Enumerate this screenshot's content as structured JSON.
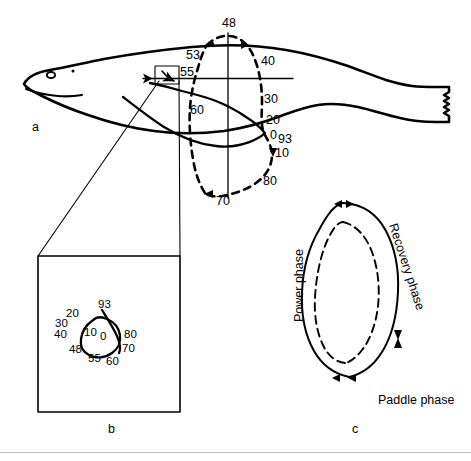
{
  "figure": {
    "caption_letters": {
      "panel_a": "a",
      "panel_b": "b",
      "panel_c": "c"
    }
  },
  "panel_a": {
    "letter": "a",
    "subject": "harbor-seal-lateral-outline",
    "trajectory_labels": [
      {
        "id": "a-48",
        "text": "48",
        "x": 222,
        "y": 27
      },
      {
        "id": "a-53",
        "text": "53",
        "x": 186,
        "y": 59
      },
      {
        "id": "a-55",
        "text": "55",
        "x": 180,
        "y": 76
      },
      {
        "id": "a-40",
        "text": "40",
        "x": 261,
        "y": 65
      },
      {
        "id": "a-30",
        "text": "30",
        "x": 264,
        "y": 103
      },
      {
        "id": "a-60",
        "text": "60",
        "x": 190,
        "y": 114
      },
      {
        "id": "a-20",
        "text": "20",
        "x": 266,
        "y": 124
      },
      {
        "id": "a-0",
        "text": "0",
        "x": 272,
        "y": 137
      },
      {
        "id": "a-93",
        "text": "93",
        "x": 279,
        "y": 140
      },
      {
        "id": "a-10",
        "text": "10",
        "x": 275,
        "y": 155
      },
      {
        "id": "a-80",
        "text": "80",
        "x": 263,
        "y": 183
      },
      {
        "id": "a-70",
        "text": "70",
        "x": 218,
        "y": 203
      }
    ]
  },
  "panel_b": {
    "letter": "b",
    "description": "magnified-stroke-loop",
    "loop_labels": [
      {
        "id": "b-20",
        "text": "20",
        "x": 72,
        "y": 315
      },
      {
        "id": "b-93",
        "text": "93",
        "x": 103,
        "y": 307
      },
      {
        "id": "b-30",
        "text": "30",
        "x": 60,
        "y": 325
      },
      {
        "id": "b-40",
        "text": "40",
        "x": 59,
        "y": 336
      },
      {
        "id": "b-10",
        "text": "10",
        "x": 86,
        "y": 331
      },
      {
        "id": "b-0",
        "text": "0",
        "x": 101,
        "y": 334
      },
      {
        "id": "b-80",
        "text": "80",
        "x": 123,
        "y": 332
      },
      {
        "id": "b-48",
        "text": "48",
        "x": 72,
        "y": 350
      },
      {
        "id": "b-70",
        "text": "70",
        "x": 122,
        "y": 349
      },
      {
        "id": "b-55",
        "text": "55",
        "x": 90,
        "y": 359
      },
      {
        "id": "b-60",
        "text": "60",
        "x": 108,
        "y": 361
      }
    ]
  },
  "panel_c": {
    "letter": "c",
    "description": "stroke-cycle-phase-diagram",
    "phases": [
      {
        "id": "power-phase",
        "label": "Power phase",
        "orientation": "vertical-up"
      },
      {
        "id": "recovery-phase",
        "label": "Recovery phase",
        "orientation": "rotated-down"
      },
      {
        "id": "paddle-phase",
        "label": "Paddle phase",
        "orientation": "horizontal"
      }
    ]
  },
  "colors": {
    "ink": "#000000",
    "background": "#ffffff",
    "rule": "#b9b9b9"
  }
}
